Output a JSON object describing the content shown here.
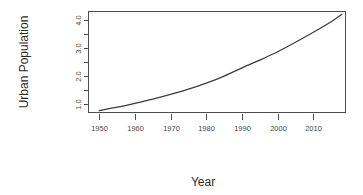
{
  "chart_data": {
    "type": "line",
    "title": "",
    "xlabel": "Year",
    "ylabel": "Urban Population",
    "xlim": [
      1947,
      2019
    ],
    "ylim": [
      0.68,
      4.32
    ],
    "grid": false,
    "legend": null,
    "x_ticks": [
      1950,
      1960,
      1970,
      1980,
      1990,
      2000,
      2010
    ],
    "x_tick_labels": [
      "1950",
      "1960",
      "1970",
      "1980",
      "1990",
      "2000",
      "2010"
    ],
    "y_ticks": [
      1.0,
      1.5,
      2.0,
      2.5,
      3.0,
      3.5,
      4.0
    ],
    "y_tick_labels": [
      "1.0",
      "",
      "2.0",
      "",
      "3.0",
      "",
      "4.0"
    ],
    "y_major_tick_labels": [
      "1.0",
      "2.0",
      "3.0",
      "4.0"
    ],
    "series": [
      {
        "name": "Urban Population",
        "color": "#3c3c3c",
        "x": [
          1950,
          1955,
          1960,
          1965,
          1970,
          1975,
          1980,
          1985,
          1990,
          1995,
          2000,
          2005,
          2010,
          2015,
          2018
        ],
        "values": [
          0.75,
          0.87,
          1.01,
          1.16,
          1.33,
          1.52,
          1.74,
          1.99,
          2.29,
          2.57,
          2.87,
          3.21,
          3.57,
          3.95,
          4.22
        ]
      }
    ]
  },
  "axes": {
    "y_title": "Urban Population",
    "x_title": "Year"
  }
}
